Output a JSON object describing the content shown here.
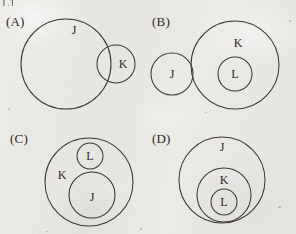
{
  "document": {
    "kind": "scanned-worksheet-figure",
    "top_cut_text": "L1",
    "background_color": "#eceae7",
    "ink_color": "#3a3733"
  },
  "panels": [
    {
      "tag": "(A)",
      "tag_x": 6,
      "tag_y": 14,
      "relation": "J and K overlap partially",
      "circles": [
        {
          "label": "J",
          "cx": 66,
          "cy": 64,
          "r": 45,
          "label_x": 74,
          "label_y": 30
        },
        {
          "label": "K",
          "cx": 116,
          "cy": 64,
          "r": 19,
          "label_x": 123,
          "label_y": 64
        }
      ]
    },
    {
      "tag": "(B)",
      "tag_x": 152,
      "tag_y": 14,
      "relation": "J disjoint from K; L inside K",
      "circles": [
        {
          "label": "J",
          "cx": 172,
          "cy": 74,
          "r": 21,
          "label_x": 172,
          "label_y": 74
        },
        {
          "label": "K",
          "cx": 235,
          "cy": 65,
          "r": 44,
          "label_x": 238,
          "label_y": 43
        },
        {
          "label": "L",
          "cx": 235,
          "cy": 74,
          "r": 17,
          "label_x": 235,
          "label_y": 74
        }
      ]
    },
    {
      "tag": "(C)",
      "tag_x": 10,
      "tag_y": 131,
      "relation": "L inside K; J inside K; L and J disjoint",
      "circles": [
        {
          "label": "K",
          "cx": 89,
          "cy": 182,
          "r": 44,
          "label_x": 62,
          "label_y": 175
        },
        {
          "label": "L",
          "cx": 90,
          "cy": 156,
          "r": 13,
          "label_x": 90,
          "label_y": 156
        },
        {
          "label": "J",
          "cx": 92,
          "cy": 195,
          "r": 23,
          "label_x": 92,
          "label_y": 197
        }
      ]
    },
    {
      "tag": "(D)",
      "tag_x": 152,
      "tag_y": 131,
      "relation": "L inside K inside J",
      "circles": [
        {
          "label": "J",
          "cx": 222,
          "cy": 180,
          "r": 43,
          "label_x": 222,
          "label_y": 147
        },
        {
          "label": "K",
          "cx": 224,
          "cy": 195,
          "r": 27,
          "label_x": 224,
          "label_y": 180
        },
        {
          "label": "L",
          "cx": 224,
          "cy": 202,
          "r": 13,
          "label_x": 224,
          "label_y": 202
        }
      ]
    }
  ]
}
